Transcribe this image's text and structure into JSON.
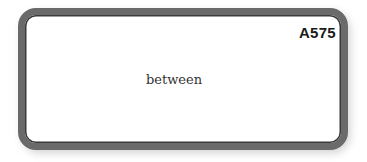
{
  "card": {
    "code": "A575",
    "word": "between"
  },
  "colors": {
    "border": "#6a6a6a",
    "background": "#ffffff",
    "text": "#333333"
  }
}
